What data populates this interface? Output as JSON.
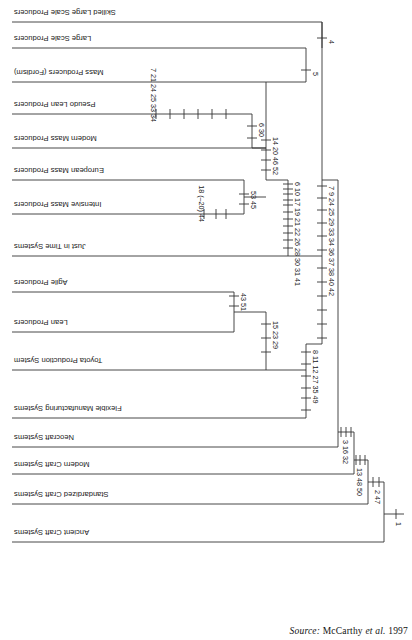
{
  "figure": {
    "type": "cladogram",
    "orientation": "rotated-180",
    "source_label": "Source:",
    "source_author": "McCarthy",
    "source_etal": "et al.",
    "source_year": "1997"
  },
  "taxa": [
    {
      "id": "ancient-craft",
      "label": "Ancient Craft Systems"
    },
    {
      "id": "standardized-craft",
      "label": "Standardized Craft Systems"
    },
    {
      "id": "modern-craft",
      "label": "Modern Craft Systems"
    },
    {
      "id": "neocraft",
      "label": "Neocraft Systems"
    },
    {
      "id": "flexible-manu",
      "label": "Flexible Manufacturing Systems"
    },
    {
      "id": "toyota",
      "label": "Toyota Production System"
    },
    {
      "id": "lean",
      "label": "Lean Producers"
    },
    {
      "id": "agile",
      "label": "Agile Producers"
    },
    {
      "id": "jit",
      "label": "Just in Time Systems"
    },
    {
      "id": "intensive-mass",
      "label": "Intensive Mass Producers"
    },
    {
      "id": "european-mass",
      "label": "European Mass Producers"
    },
    {
      "id": "modern-mass",
      "label": "Modern Mass Producers"
    },
    {
      "id": "pseudo-lean",
      "label": "Pseudo Lean Producers"
    },
    {
      "id": "mass-fordism",
      "label": "Mass Producers (Fordism)"
    },
    {
      "id": "large-scale",
      "label": "Large Scale Producers"
    },
    {
      "id": "skilled-large-scale",
      "label": "Skilled Large Scale Producers"
    }
  ],
  "character_labels": {
    "root": "1",
    "node_2_47": "2 47",
    "node_13_48_50": "13 48 50",
    "node_3_16_32": "3 16 32",
    "branch_7_9_24_25_29_33_34_36_37_38_40_42": "7 9 24 25 29 33 34 36 37 38 40 42",
    "branch_8_11_12_27_35_49": "8 11 12 27 35 49",
    "branch_15_23_29": "15 23 29",
    "branch_43_51": "43 51",
    "branch_6_10_17_19_21_22_26_28_30_31_41": "6 10 17 19 21 22 26 28 30 31 41",
    "branch_53_45": "53 45",
    "branch_18_m20_44": "18 (–20) 44",
    "branch_14_20_46_52": "14 20 46 52",
    "branch_6_30": "6 30",
    "branch_7_21_24_25_33_34": "7 21 24 25 33 34",
    "node_5": "5",
    "node_4": "4"
  },
  "character_tick_groups": {
    "node_2_47": [
      "2",
      "47"
    ],
    "node_13_48_50": [
      "13",
      "48",
      "50"
    ],
    "node_3_16_32": [
      "3",
      "16",
      "32"
    ],
    "stem_left": [
      "7",
      "9",
      "24",
      "25",
      "29",
      "33",
      "34",
      "36",
      "37",
      "38",
      "40",
      "42"
    ],
    "toyota_stem": [
      "8",
      "11",
      "12",
      "27",
      "35",
      "49"
    ],
    "lean_agile_stem": [
      "15",
      "23",
      "29"
    ],
    "agile_stem": [
      "43",
      "51"
    ],
    "mass_stem": [
      "6",
      "10",
      "17",
      "19",
      "21",
      "22",
      "26",
      "28",
      "30",
      "31",
      "41"
    ],
    "euro_intensive_stem": [
      "53",
      "45"
    ],
    "intensive_stem": [
      "18",
      "(–20)",
      "44"
    ],
    "upper_stem": [
      "14",
      "20",
      "46",
      "52"
    ],
    "pseudo_modern_stem": [
      "6",
      "30"
    ],
    "pseudo_stem": [
      "7",
      "21",
      "24",
      "25",
      "33",
      "34"
    ],
    "node_5": [
      "5"
    ],
    "node_4": [
      "4"
    ]
  },
  "colors": {
    "line": "#333333",
    "text": "#1a1a1a",
    "background": "#ffffff"
  }
}
